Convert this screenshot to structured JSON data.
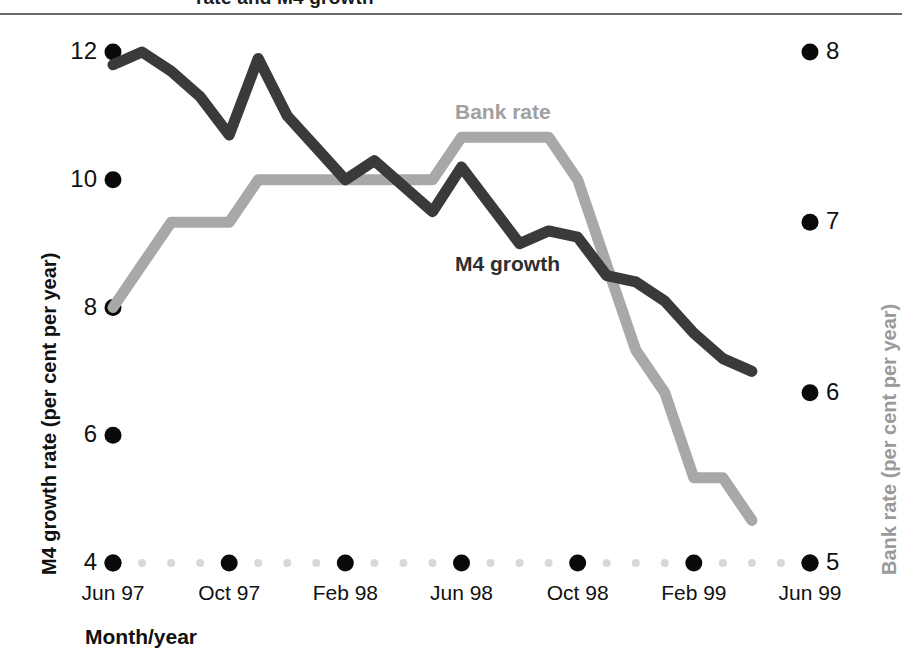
{
  "page": {
    "clipped_header": "rate and M4 growth",
    "background": "#ffffff"
  },
  "chart_data": {
    "type": "line",
    "title": "",
    "xlabel": "Month/year",
    "ylabel": "M4 growth rate (per cent per year)",
    "y2label": "Bank rate (per cent per year)",
    "grid": false,
    "legend_position": "inline-annotations",
    "categories": [
      "Jun 97",
      "Jul 97",
      "Aug 97",
      "Sep 97",
      "Oct 97",
      "Nov 97",
      "Dec 97",
      "Jan 98",
      "Feb 98",
      "Mar 98",
      "Apr 98",
      "May 98",
      "Jun 98",
      "Jul 98",
      "Aug 98",
      "Sep 98",
      "Oct 98",
      "Nov 98",
      "Dec 98",
      "Jan 99",
      "Feb 99",
      "Mar 99",
      "Apr 99",
      "May 99",
      "Jun 99"
    ],
    "xticks": [
      "Jun 97",
      "Oct 97",
      "Feb 98",
      "Jun 98",
      "Oct 98",
      "Feb 99",
      "Jun 99"
    ],
    "xtick_positions": [
      0,
      4,
      8,
      12,
      16,
      20,
      24
    ],
    "ylim": [
      4,
      12
    ],
    "yticks": [
      4,
      6,
      8,
      10,
      12
    ],
    "y2lim": [
      5,
      8
    ],
    "y2ticks": [
      5,
      6,
      7,
      8
    ],
    "series": [
      {
        "name": "M4 growth",
        "axis": "left",
        "color": "#3a3a3a",
        "label_color": "#2e2e2e",
        "values": [
          11.8,
          12.0,
          11.7,
          11.3,
          10.7,
          11.9,
          11.0,
          10.5,
          10.0,
          10.3,
          9.9,
          9.5,
          10.2,
          9.6,
          9.0,
          9.2,
          9.1,
          8.5,
          8.4,
          8.1,
          7.6,
          7.2,
          7.0,
          null,
          null
        ]
      },
      {
        "name": "Bank rate",
        "axis": "right",
        "color": "#a8a8a8",
        "label_color": "#a0a0a0",
        "values": [
          6.5,
          6.75,
          7.0,
          7.0,
          7.0,
          7.25,
          7.25,
          7.25,
          7.25,
          7.25,
          7.25,
          7.25,
          7.5,
          7.5,
          7.5,
          7.5,
          7.25,
          6.75,
          6.25,
          6.0,
          5.5,
          5.5,
          5.25,
          null,
          null
        ]
      }
    ],
    "annotations": [
      {
        "text": "Bank rate",
        "series": "Bank rate"
      },
      {
        "text": "M4 growth",
        "series": "M4 growth"
      }
    ]
  }
}
